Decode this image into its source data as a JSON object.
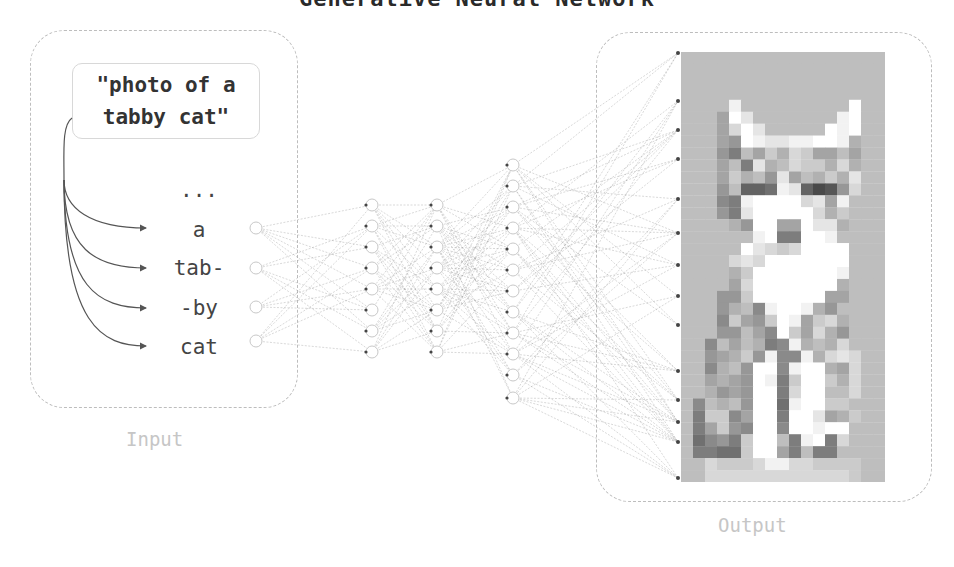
{
  "title": "Generative Neural Network",
  "input": {
    "label": "Input",
    "prompt_line1": "\"photo of a",
    "prompt_line2": "tabby cat\"",
    "tokens": [
      {
        "text": "...",
        "y": 178
      },
      {
        "text": "a",
        "y": 218
      },
      {
        "text": "tab-",
        "y": 256
      },
      {
        "text": "-by",
        "y": 296
      },
      {
        "text": "cat",
        "y": 335
      }
    ]
  },
  "output": {
    "label": "Output",
    "image_description": "pixelated grayscale tabby cat"
  },
  "network": {
    "layers": [
      {
        "name": "input",
        "x": 256,
        "r": 6,
        "nodes": [
          228,
          268,
          307,
          341
        ]
      },
      {
        "name": "hidden1",
        "x": 372,
        "r": 6,
        "nodes": [
          205,
          226,
          247,
          268,
          289,
          310,
          331,
          352
        ]
      },
      {
        "name": "hidden2",
        "x": 437,
        "r": 6,
        "nodes": [
          205,
          226,
          247,
          268,
          289,
          310,
          331,
          352
        ]
      },
      {
        "name": "hidden3",
        "x": 513,
        "r": 6,
        "nodes": [
          165,
          186,
          207,
          228,
          249,
          270,
          291,
          312,
          333,
          354,
          375,
          398
        ]
      },
      {
        "name": "output",
        "x": 678,
        "r": 2,
        "nodes": [
          53,
          101,
          130,
          159,
          199,
          233,
          265,
          296,
          325,
          371,
          400,
          422,
          442,
          478
        ]
      }
    ],
    "colors": {
      "edge": "#9a9a9a",
      "node_stroke": "#c8c8c8",
      "node_dot": "#444444",
      "arrow": "#555555"
    }
  },
  "cat_image": {
    "cols": 17,
    "rows": 36,
    "grid": [
      "aaaaaaaaaaaaaaaaa",
      "aaaaaaaaaaaaaaaaa",
      "aaaaaaaaaaaaaaaaa",
      "aaaaaaaaaaaaaaaaa",
      "aaaaeaaaaaaaaafaa",
      "aaa8fdaaaaaaaefaa",
      "aaa8cfdaaaaafefaa",
      "aaa87feddeeffe9aa",
      "aaa75a8b9cb88a8aa",
      "aaa8a5d9acbb9c9aa",
      "aaa8b9a7d8a9b9daa",
      "aaa7a334ed3127caa",
      "aaa65effffcd8eaaa",
      "aaa75dfffffc9baaa",
      "aaaa97ff88fdd9aaa",
      "aaaaaaef55ffeaaaa",
      "aaaaafdcbcffffaaa",
      "aaaacdcfffffffaaa",
      "aaaa9bfffffffeaaa",
      "aaaa8cfffffff9aaa",
      "aaa77bffffff88aaa",
      "aaa79a6effe97aaaa",
      "aaa6b87bfe8bc9aaa",
      "aaa77a86fb8c97aaa",
      "aa6a8a956e9a9caaa",
      "aa789b7e66e9cdcaa",
      "aa69a7ff6eff98caa",
      "aa8987fe5bffb9caa",
      "aa9787ff5cffaacaa",
      "a6a9a7ff4effbbaaa",
      "a5bb68ff5ffd89baa",
      "a58b76ff6ffeffaaa",
      "a4675bffa5ef5caaa",
      "a5544bff85a55aaaa",
      "aacbbbceeccbbbbaa",
      "aaccccccccccccbaa"
    ]
  }
}
